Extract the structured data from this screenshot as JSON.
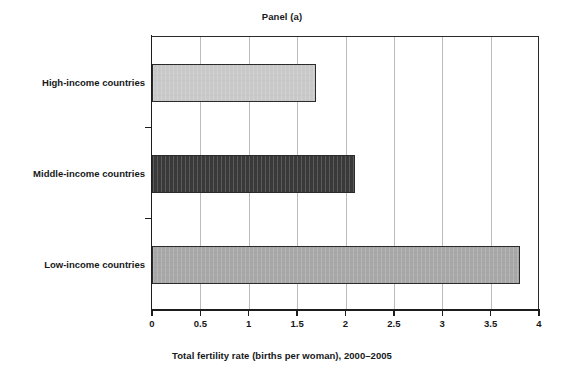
{
  "chart_data": {
    "type": "bar",
    "orientation": "horizontal",
    "title": "Panel (a)",
    "xlabel": "Total fertility rate (births per woman), 2000–2005",
    "ylabel": "",
    "categories": [
      "Low-income countries",
      "Middle-income countries",
      "High-income countries"
    ],
    "values": [
      3.8,
      2.1,
      1.7
    ],
    "bar_colors": [
      "#a8a8a8",
      "#3a3a3a",
      "#c9c9c9"
    ],
    "bar_edge_color": "#2b2b2b",
    "xlim": [
      0,
      4
    ],
    "xticks": [
      0,
      0.5,
      1,
      1.5,
      2,
      2.5,
      3,
      3.5,
      4
    ],
    "xtick_labels": [
      "0",
      "0.5",
      "1",
      "1.5",
      "2",
      "2.5",
      "3",
      "3.5",
      "4"
    ],
    "grid": "vertical",
    "grid_color": "#b9bcc0",
    "legend": null,
    "background": "#ffffff",
    "series": [
      {
        "name": "Total fertility rate (births per woman), 2000–2005",
        "points": [
          {
            "category": "High-income countries",
            "value": 1.7,
            "color": "#c9c9c9"
          },
          {
            "category": "Middle-income countries",
            "value": 2.1,
            "color": "#3a3a3a"
          },
          {
            "category": "Low-income countries",
            "value": 3.8,
            "color": "#a8a8a8"
          }
        ]
      }
    ]
  }
}
